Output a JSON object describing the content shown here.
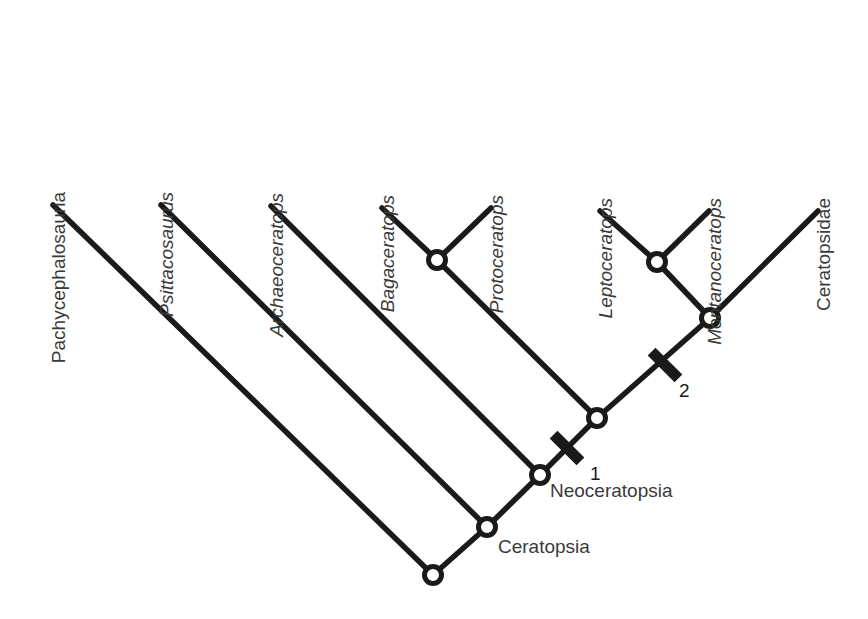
{
  "figure": {
    "kind": "cladogram",
    "background_color": "#ffffff",
    "line_color": "#1a1a1a",
    "text_color": "#3a3a3a",
    "node_fill_color": "#ffffff"
  },
  "tips": [
    {
      "id": "pachycephalosauria",
      "label": "Pachycephalosauria",
      "italic": false,
      "x": 53,
      "y": 205
    },
    {
      "id": "psittacosaurus",
      "label": "Psittacosaurus",
      "italic": true,
      "x": 161,
      "y": 205
    },
    {
      "id": "archaeoceratops",
      "label": "Archaeoceratops",
      "italic": true,
      "x": 271,
      "y": 206
    },
    {
      "id": "bagaceratops",
      "label": "Bagaceratops",
      "italic": true,
      "x": 382,
      "y": 208
    },
    {
      "id": "protoceratops",
      "label": "Protoceratops",
      "italic": true,
      "x": 491,
      "y": 208
    },
    {
      "id": "leptoceratops",
      "label": "Leptoceratops",
      "italic": true,
      "x": 600,
      "y": 211
    },
    {
      "id": "montanoceratops",
      "label": "Montanoceratops",
      "italic": true,
      "x": 709,
      "y": 211
    },
    {
      "id": "ceratopsidae",
      "label": "Ceratopsidae",
      "italic": false,
      "x": 818,
      "y": 211
    }
  ],
  "nodes": [
    {
      "id": "root",
      "x": 433,
      "y": 575
    },
    {
      "id": "ceratopsia",
      "x": 487,
      "y": 527
    },
    {
      "id": "neoceratopsia",
      "x": 540,
      "y": 475
    },
    {
      "id": "coronosauria",
      "x": 597,
      "y": 418
    },
    {
      "id": "protoceratopsidae",
      "x": 437,
      "y": 260
    },
    {
      "id": "ceratopsoidea",
      "x": 710,
      "y": 318
    },
    {
      "id": "leptoceratopsidae",
      "x": 657,
      "y": 262
    }
  ],
  "clade_labels": [
    {
      "id": "neoceratopsia-label",
      "label": "Neoceratopsia",
      "x": 550,
      "y": 497
    },
    {
      "id": "ceratopsia-label",
      "label": "Ceratopsia",
      "x": 498,
      "y": 553
    }
  ],
  "synapomorphy_markers": [
    {
      "id": "marker-1",
      "label": "1",
      "x": 567,
      "y": 448,
      "label_x": 590,
      "label_y": 480
    },
    {
      "id": "marker-2",
      "label": "2",
      "x": 665,
      "y": 365,
      "label_x": 679,
      "label_y": 397
    }
  ],
  "branches": [
    {
      "id": "branch-pachycephalosauria",
      "x1": 53,
      "y1": 205,
      "x2": 433,
      "y2": 575
    },
    {
      "id": "branch-psittacosaurus",
      "x1": 161,
      "y1": 205,
      "x2": 487,
      "y2": 527
    },
    {
      "id": "branch-archaeoceratops",
      "x1": 271,
      "y1": 206,
      "x2": 540,
      "y2": 475
    },
    {
      "id": "branch-root-ceratopsia",
      "x1": 433,
      "y1": 575,
      "x2": 487,
      "y2": 527
    },
    {
      "id": "branch-ceratopsia-neoceratopsia",
      "x1": 487,
      "y1": 527,
      "x2": 540,
      "y2": 475
    },
    {
      "id": "branch-neoceratopsia-coronosauria",
      "x1": 540,
      "y1": 475,
      "x2": 597,
      "y2": 418
    },
    {
      "id": "branch-coronosauria-protoceratopsidae",
      "x1": 597,
      "y1": 418,
      "x2": 437,
      "y2": 260
    },
    {
      "id": "branch-coronosauria-ceratopsoidea",
      "x1": 597,
      "y1": 418,
      "x2": 710,
      "y2": 318
    },
    {
      "id": "branch-bagaceratops",
      "x1": 437,
      "y1": 260,
      "x2": 382,
      "y2": 208
    },
    {
      "id": "branch-protoceratops",
      "x1": 437,
      "y1": 260,
      "x2": 491,
      "y2": 208
    },
    {
      "id": "branch-ceratopsoidea-leptoceratopsidae",
      "x1": 710,
      "y1": 318,
      "x2": 657,
      "y2": 262
    },
    {
      "id": "branch-ceratopsidae",
      "x1": 710,
      "y1": 318,
      "x2": 818,
      "y2": 211
    },
    {
      "id": "branch-leptoceratops",
      "x1": 657,
      "y1": 262,
      "x2": 600,
      "y2": 211
    },
    {
      "id": "branch-montanoceratops",
      "x1": 657,
      "y1": 262,
      "x2": 709,
      "y2": 211
    }
  ]
}
